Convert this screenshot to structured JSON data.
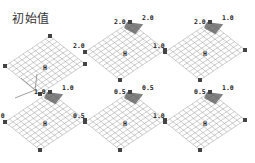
{
  "title": "初始值",
  "center_mark": "H",
  "colors": {
    "grid": "#9a9a9a",
    "peak": "#555555",
    "node": "#444444",
    "label": "#222222",
    "background": "#ffffff"
  },
  "axes_icon": {
    "labels": [
      "x",
      "y",
      "z"
    ]
  },
  "panels": [
    {
      "id": "initial",
      "row": 0,
      "col": 0,
      "labels": [],
      "peak": false
    },
    {
      "id": "r0c1",
      "row": 0,
      "col": 1,
      "labels": [
        {
          "text": "2.0",
          "pos": "left-corner"
        },
        {
          "text": "2.0",
          "pos": "top-left"
        },
        {
          "text": "2.0",
          "pos": "top-right"
        }
      ],
      "peak": true
    },
    {
      "id": "r0c2",
      "row": 0,
      "col": 2,
      "labels": [
        {
          "text": "1.0",
          "pos": "left-corner"
        },
        {
          "text": "2.0",
          "pos": "top-left"
        },
        {
          "text": "1.0",
          "pos": "top-right"
        }
      ],
      "peak": true
    },
    {
      "id": "r1c0",
      "row": 1,
      "col": 0,
      "labels": [
        {
          "text": "1.0",
          "pos": "left-corner"
        },
        {
          "text": "1.0",
          "pos": "top-left"
        },
        {
          "text": "1.0",
          "pos": "top-right"
        }
      ],
      "peak": true
    },
    {
      "id": "r1c1",
      "row": 1,
      "col": 1,
      "labels": [
        {
          "text": "0.5",
          "pos": "left-corner"
        },
        {
          "text": "0.5",
          "pos": "top-left"
        },
        {
          "text": "0.5",
          "pos": "top-right"
        }
      ],
      "peak": true
    },
    {
      "id": "r1c2",
      "row": 1,
      "col": 2,
      "labels": [
        {
          "text": "1.0",
          "pos": "left-corner"
        },
        {
          "text": "0.5",
          "pos": "top-left"
        },
        {
          "text": "1.0",
          "pos": "top-right"
        }
      ],
      "peak": true
    }
  ]
}
